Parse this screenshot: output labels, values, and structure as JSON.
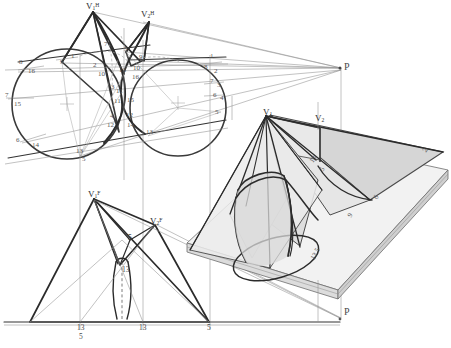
{
  "drawing": {
    "title": "Descriptive geometry: intersection of oblique cone pair with cylinder",
    "background_color": "#ffffff",
    "ink_color": "#2b2b2b",
    "construction_color": "#9a9a9a",
    "shade_light": "#e2e2e2",
    "shade_mid": "#d0d0d0",
    "shade_dark": "#bdbdbd"
  },
  "views": {
    "top": {
      "name": "horizontal-projection",
      "apex_labels": [
        {
          "id": "v1h",
          "base": "V",
          "sub": "1",
          "sup": "H",
          "x": 88,
          "y": 3
        },
        {
          "id": "v2h",
          "base": "V",
          "sub": "2",
          "sup": "H",
          "x": 143,
          "y": 11
        }
      ],
      "vanishing_point": {
        "label": "P",
        "x": 341,
        "y": 67
      },
      "left_circle_points": [
        {
          "label": "9",
          "x": 62,
          "y": 63
        },
        {
          "label": "1",
          "x": 71,
          "y": 57
        },
        {
          "label": "8",
          "x": 20,
          "y": 63
        },
        {
          "label": "16",
          "x": 29,
          "y": 72
        },
        {
          "label": "7",
          "x": 6,
          "y": 96
        },
        {
          "label": "15",
          "x": 16,
          "y": 105
        },
        {
          "label": "6",
          "x": 17,
          "y": 141
        },
        {
          "label": "14",
          "x": 33,
          "y": 146
        },
        {
          "label": "13",
          "x": 78,
          "y": 152
        },
        {
          "label": "5",
          "x": 84,
          "y": 160
        }
      ],
      "cusp_points": [
        {
          "label": "2",
          "x": 95,
          "y": 66
        },
        {
          "label": "10",
          "x": 100,
          "y": 75
        },
        {
          "label": "3",
          "x": 114,
          "y": 70
        },
        {
          "label": "11",
          "x": 117,
          "y": 91
        },
        {
          "label": "4",
          "x": 111,
          "y": 117
        },
        {
          "label": "12",
          "x": 108,
          "y": 126
        },
        {
          "label": "3",
          "x": 112,
          "y": 86
        },
        {
          "label": "11",
          "x": 117,
          "y": 100
        },
        {
          "label": "15",
          "x": 129,
          "y": 99
        },
        {
          "label": "12",
          "x": 128,
          "y": 116
        },
        {
          "label": "14",
          "x": 129,
          "y": 126
        },
        {
          "label": "5",
          "x": 126,
          "y": 50
        },
        {
          "label": "9",
          "x": 140,
          "y": 58
        },
        {
          "label": "13",
          "x": 122,
          "y": 71
        },
        {
          "label": "10",
          "x": 135,
          "y": 69
        },
        {
          "label": "16",
          "x": 134,
          "y": 77
        },
        {
          "label": "7",
          "x": 105,
          "y": 45
        }
      ],
      "right_circle_points": [
        {
          "label": "13",
          "x": 148,
          "y": 133
        },
        {
          "label": "1",
          "x": 211,
          "y": 57
        },
        {
          "label": "8",
          "x": 205,
          "y": 68
        },
        {
          "label": "2",
          "x": 215,
          "y": 72
        },
        {
          "label": "7",
          "x": 211,
          "y": 82
        },
        {
          "label": "3",
          "x": 218,
          "y": 86
        },
        {
          "label": "6",
          "x": 214,
          "y": 96
        },
        {
          "label": "4",
          "x": 221,
          "y": 99
        },
        {
          "label": "5",
          "x": 216,
          "y": 113
        }
      ]
    },
    "front": {
      "name": "frontal-projection",
      "apex_labels": [
        {
          "id": "v1f",
          "base": "V",
          "sub": "1",
          "sup": "F",
          "x": 90,
          "y": 191
        },
        {
          "id": "v2f",
          "base": "V",
          "sub": "2",
          "sup": "F",
          "x": 152,
          "y": 218
        }
      ],
      "points": [
        {
          "label": "5",
          "x": 129,
          "y": 237
        },
        {
          "label": "13",
          "x": 124,
          "y": 270
        },
        {
          "label": "3",
          "x": 122,
          "y": 269
        }
      ],
      "ground_labels": [
        {
          "label": "13",
          "x": 79,
          "y": 327
        },
        {
          "label": "5",
          "x": 80,
          "y": 336
        },
        {
          "label": "13",
          "x": 141,
          "y": 327
        },
        {
          "label": "5",
          "x": 209,
          "y": 327
        }
      ]
    },
    "pictorial": {
      "name": "isometric-pictorial",
      "apex_labels": [
        {
          "id": "v1",
          "base": "V",
          "sub": "1",
          "sup": "",
          "x": 266,
          "y": 112
        },
        {
          "id": "v2",
          "base": "V",
          "sub": "2",
          "sup": "",
          "x": 318,
          "y": 118
        }
      ],
      "points": [
        {
          "label": "13",
          "x": 312,
          "y": 158
        },
        {
          "label": "5",
          "x": 323,
          "y": 168
        },
        {
          "label": "2",
          "x": 426,
          "y": 150
        },
        {
          "label": "6",
          "x": 377,
          "y": 197
        },
        {
          "label": "9",
          "x": 351,
          "y": 215
        },
        {
          "label": "5",
          "x": 318,
          "y": 250
        },
        {
          "label": "13",
          "x": 313,
          "y": 256
        }
      ],
      "vanishing_point": {
        "label": "P",
        "x": 341,
        "y": 312
      }
    }
  }
}
